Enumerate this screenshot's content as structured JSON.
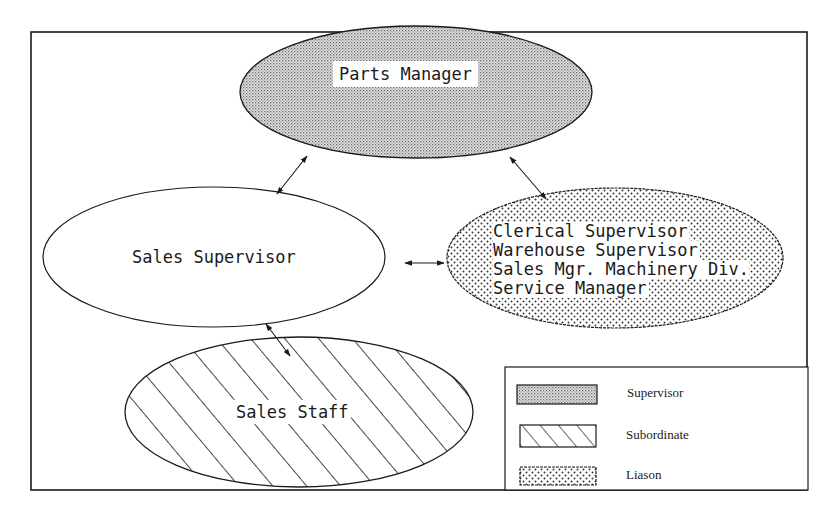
{
  "diagram": {
    "type": "organizational-relationship-diagram",
    "nodes": {
      "parts_manager": {
        "label": "Parts Manager",
        "category": "Supervisor"
      },
      "sales_supervisor": {
        "label": "Sales Supervisor",
        "category": "none"
      },
      "liaison_group": {
        "lines": [
          "Clerical Supervisor",
          "Warehouse Supervisor",
          "Sales Mgr. Machinery Div.",
          "Service Manager"
        ],
        "category": "Liason"
      },
      "sales_staff": {
        "label": "Sales Staff",
        "category": "Subordinate"
      }
    },
    "edges": [
      {
        "from": "Parts Manager",
        "to": "Sales Supervisor",
        "type": "bidirectional-arrow"
      },
      {
        "from": "Parts Manager",
        "to": "Clerical Supervisor / Warehouse Supervisor / Sales Mgr. Machinery Div. / Service Manager",
        "type": "bidirectional-arrow"
      },
      {
        "from": "Sales Supervisor",
        "to": "Clerical Supervisor / Warehouse Supervisor / Sales Mgr. Machinery Div. / Service Manager",
        "type": "bidirectional-arrow"
      },
      {
        "from": "Sales Supervisor",
        "to": "Sales Staff",
        "type": "bidirectional-arrow"
      }
    ],
    "legend": {
      "items": [
        {
          "label": "Supervisor",
          "pattern": "fine-dot-gray"
        },
        {
          "label": "Subordinate",
          "pattern": "diagonal-hatch"
        },
        {
          "label": "Liason",
          "pattern": "coarse-dot"
        }
      ]
    },
    "colors": {
      "line": "#1a1a1a",
      "background": "#ffffff",
      "supervisor_fill": "#c8c8c8"
    }
  }
}
